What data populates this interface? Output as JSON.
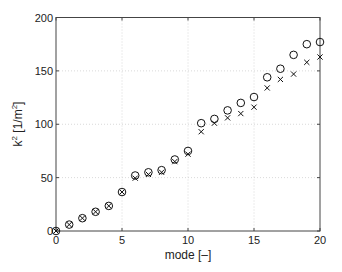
{
  "chart_data": {
    "type": "scatter",
    "title": "",
    "xlabel": "mode [–]",
    "ylabel": "k² [1/m²]",
    "xlim": [
      0,
      20
    ],
    "ylim": [
      0,
      200
    ],
    "xticks": [
      0,
      5,
      10,
      15,
      20
    ],
    "yticks": [
      0,
      50,
      100,
      150,
      200
    ],
    "xtick_labels": [
      "0",
      "5",
      "10",
      "15",
      "20"
    ],
    "ytick_labels": [
      "0",
      "50",
      "100",
      "150",
      "200"
    ],
    "grid": true,
    "legend": null,
    "x": [
      0,
      1,
      2,
      3,
      4,
      5,
      6,
      7,
      8,
      9,
      10,
      11,
      12,
      13,
      14,
      15,
      16,
      17,
      18,
      19,
      20
    ],
    "series": [
      {
        "name": "circles",
        "marker": "o",
        "values": [
          0,
          6,
          12,
          18,
          23.5,
          36.5,
          52,
          55,
          57,
          67,
          75,
          101,
          105,
          113,
          120,
          125.5,
          144,
          152,
          165,
          175,
          177
        ]
      },
      {
        "name": "crosses",
        "marker": "x",
        "values": [
          0,
          6,
          12,
          18,
          23.5,
          36.5,
          49.5,
          53,
          55,
          65,
          72,
          93,
          101,
          106,
          110,
          116,
          134,
          142,
          147,
          158,
          163
        ]
      }
    ]
  },
  "labels": {
    "xlabel": "mode [–]",
    "ylabel_base": "k",
    "ylabel_sup": "2",
    "ylabel_unit_pre": " [1/m",
    "ylabel_unit_sup": "2",
    "ylabel_unit_post": "]"
  }
}
